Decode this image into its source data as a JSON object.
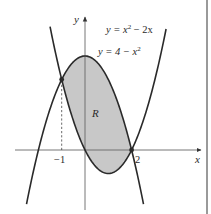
{
  "chart_data": {
    "type": "diagram",
    "title": "",
    "xlabel": "x",
    "ylabel": "y",
    "x_ticks": [
      {
        "value": -1,
        "label": "−1"
      },
      {
        "value": 2,
        "label": "2"
      }
    ],
    "curves": [
      {
        "name": "upper",
        "equation": "y = 4 − x²",
        "label_text": "y = 4 − x",
        "label_sup": "2",
        "x_range": [
          -2.51,
          2.51
        ]
      },
      {
        "name": "lower",
        "equation": "y = x² − 2x",
        "label_text": "y = x",
        "label_sup": "2",
        "label_tail": " − 2x",
        "x_range": [
          -1.5,
          3.48
        ]
      }
    ],
    "intersections": [
      {
        "x": -1,
        "y": 3
      },
      {
        "x": 2,
        "y": 0
      }
    ],
    "region": {
      "label": "R",
      "between": [
        "y = 4 − x²",
        "y = x² − 2x"
      ],
      "x_range": [
        -1,
        2
      ],
      "fill": "#c8c8c8"
    },
    "dashed_guide": {
      "x": -1,
      "from_y": 0,
      "to_y": 3
    },
    "colors": {
      "curve": "#2a2a2a",
      "axis": "#555555",
      "region": "#c8c8c8",
      "border": "#9a9a9a"
    }
  },
  "labels": {
    "x_axis": "x",
    "y_axis": "y",
    "region": "R",
    "tick_neg1": "−1",
    "tick_2": "2",
    "curve1_main": "y = x",
    "curve1_sup": "2",
    "curve1_tail": " − 2x",
    "curve2_main": "y = 4 − x",
    "curve2_sup": "2"
  }
}
